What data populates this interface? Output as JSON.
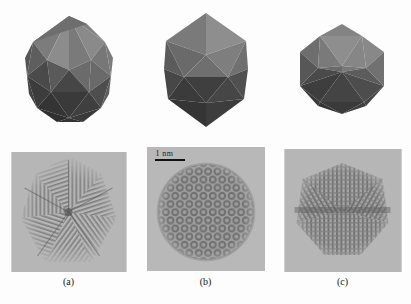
{
  "figure": {
    "kind": "multi-panel-scientific-figure",
    "panel_count": 3,
    "row_top": "polyhedral-model-renders",
    "row_bottom": "hrtem-micrographs"
  },
  "scalebar": {
    "label": "1 nm",
    "length_px": 30,
    "panel": "b"
  },
  "captions": [
    {
      "id": "a",
      "text": "(a)"
    },
    {
      "id": "b",
      "text": "(b)"
    },
    {
      "id": "c",
      "text": "(c)"
    }
  ],
  "models": [
    {
      "id": "model-a",
      "name": "icosahedron-fivefold-axis",
      "orientation": "5-fold axis",
      "facet_shades": [
        "#8d8d8d",
        "#6f6f6f",
        "#575757",
        "#3a3a3a",
        "#4a4a4a",
        "#7e7e7e"
      ]
    },
    {
      "id": "model-b",
      "name": "icosahedron-threefold-axis",
      "orientation": "3-fold axis",
      "facet_shades": [
        "#8d8d8d",
        "#717171",
        "#5a5a5a",
        "#3d3d3d",
        "#4d4d4d",
        "#828282"
      ]
    },
    {
      "id": "model-c",
      "name": "icosahedron-twofold-axis",
      "orientation": "2-fold axis",
      "facet_shades": [
        "#909090",
        "#747474",
        "#5c5c5c",
        "#3f3f3f",
        "#505050",
        "#848484"
      ]
    }
  ],
  "micrographs": [
    {
      "id": "micrograph-a",
      "name": "hrtem-fivefold-star",
      "pattern": "radial star, five-fold lattice fringes",
      "background": "#b6b6b6",
      "fringe_color": "#6a6a6a"
    },
    {
      "id": "micrograph-b",
      "name": "hrtem-threefold-rings",
      "pattern": "hexagonal ring (donut) lattice",
      "background": "#b8b8b8",
      "fringe_color": "#737373"
    },
    {
      "id": "micrograph-c",
      "name": "hrtem-twofold-fringes",
      "pattern": "crossed lattice fringes, twofold symmetry",
      "background": "#b6b6b6",
      "fringe_color": "#6d6d6d"
    }
  ],
  "colors": {
    "page_background": "#fdfdfd",
    "panel_background": "#b6b6b6",
    "caption_text": "#161616",
    "scalebar_line": "#101010"
  }
}
